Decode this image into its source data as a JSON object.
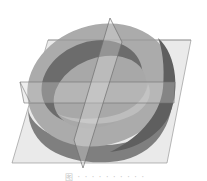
{
  "figure": {
    "shapes": {
      "ring_outer_top": "#9a9a9a",
      "ring_top_face": "#b3b3b3",
      "ring_inner_wall": "#6f6f6f",
      "ring_side_wall": "#7d7d7d",
      "inner_floor": "#a6a6a6",
      "plane_fill": "#d9d9d9",
      "plane_stroke": "#7a7a7a"
    }
  },
  "caption": {
    "text": "图 · · · · · · · · · ·"
  }
}
